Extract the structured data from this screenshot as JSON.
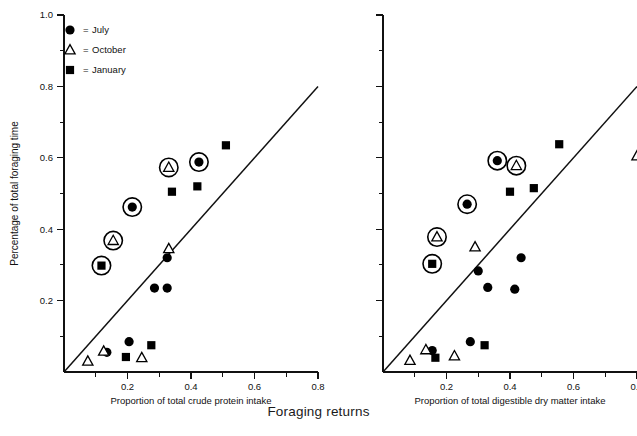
{
  "figure": {
    "shared_xlabel": "Foraging returns",
    "ylabel": "Percentage of total foraging time"
  },
  "legend": {
    "items": [
      {
        "symbol": "filled-circle",
        "separator": "=",
        "label": "July"
      },
      {
        "symbol": "open-triangle",
        "separator": "=",
        "label": "October"
      },
      {
        "symbol": "filled-square",
        "separator": "=",
        "label": "January"
      }
    ]
  },
  "axes": {
    "y_ticks": [
      "0.2",
      "0.4",
      "0.6",
      "0.8",
      "1.0"
    ],
    "x_ticks": [
      "0.2",
      "0.4",
      "0.6",
      "0.8"
    ],
    "y_tick_values": [
      0.2,
      0.4,
      0.6,
      0.8,
      1.0
    ],
    "x_tick_values": [
      0.2,
      0.4,
      0.6,
      0.8
    ],
    "y_minor_values": [
      0.1,
      0.3,
      0.5,
      0.7,
      0.9
    ],
    "x_minor_values": [
      0.1,
      0.3,
      0.5,
      0.7
    ]
  },
  "chart_data": [
    {
      "type": "scatter",
      "panel": "left",
      "title": "",
      "xlabel": "Proportion of total crude protein intake",
      "ylabel": "Percentage of total foraging time",
      "xlim": [
        0.0,
        0.8
      ],
      "ylim": [
        0.0,
        1.0
      ],
      "grid": false,
      "legend_position": "top-left",
      "reference_line": {
        "label": "1:1 line",
        "x": [
          0.0,
          0.8
        ],
        "y": [
          0.0,
          0.8
        ]
      },
      "series": [
        {
          "name": "July",
          "marker": "filled-circle",
          "points": [
            {
              "x": 0.135,
              "y": 0.055,
              "highlighted": false
            },
            {
              "x": 0.205,
              "y": 0.085,
              "highlighted": false
            },
            {
              "x": 0.285,
              "y": 0.235,
              "highlighted": false
            },
            {
              "x": 0.325,
              "y": 0.235,
              "highlighted": false
            },
            {
              "x": 0.325,
              "y": 0.32,
              "highlighted": false
            },
            {
              "x": 0.215,
              "y": 0.462,
              "highlighted": true
            },
            {
              "x": 0.425,
              "y": 0.588,
              "highlighted": true
            }
          ]
        },
        {
          "name": "October",
          "marker": "open-triangle",
          "points": [
            {
              "x": 0.075,
              "y": 0.03,
              "highlighted": false
            },
            {
              "x": 0.125,
              "y": 0.058,
              "highlighted": false
            },
            {
              "x": 0.245,
              "y": 0.04,
              "highlighted": false
            },
            {
              "x": 0.33,
              "y": 0.345,
              "highlighted": false
            },
            {
              "x": 0.155,
              "y": 0.368,
              "highlighted": true
            },
            {
              "x": 0.33,
              "y": 0.573,
              "highlighted": true
            }
          ]
        },
        {
          "name": "January",
          "marker": "filled-square",
          "points": [
            {
              "x": 0.195,
              "y": 0.042,
              "highlighted": false
            },
            {
              "x": 0.275,
              "y": 0.075,
              "highlighted": false
            },
            {
              "x": 0.34,
              "y": 0.505,
              "highlighted": false
            },
            {
              "x": 0.42,
              "y": 0.52,
              "highlighted": false
            },
            {
              "x": 0.51,
              "y": 0.635,
              "highlighted": false
            },
            {
              "x": 0.118,
              "y": 0.298,
              "highlighted": true
            }
          ]
        }
      ]
    },
    {
      "type": "scatter",
      "panel": "right",
      "title": "",
      "xlabel": "Proportion of total digestible dry matter intake",
      "ylabel": "Percentage of total foraging time",
      "xlim": [
        0.0,
        0.8
      ],
      "ylim": [
        0.0,
        1.0
      ],
      "grid": false,
      "legend_position": "none",
      "reference_line": {
        "label": "1:1 line",
        "x": [
          0.0,
          0.8
        ],
        "y": [
          0.0,
          0.8
        ]
      },
      "series": [
        {
          "name": "July",
          "marker": "filled-circle",
          "points": [
            {
              "x": 0.155,
              "y": 0.06,
              "highlighted": false
            },
            {
              "x": 0.275,
              "y": 0.085,
              "highlighted": false
            },
            {
              "x": 0.33,
              "y": 0.237,
              "highlighted": false
            },
            {
              "x": 0.415,
              "y": 0.232,
              "highlighted": false
            },
            {
              "x": 0.3,
              "y": 0.283,
              "highlighted": false
            },
            {
              "x": 0.435,
              "y": 0.32,
              "highlighted": false
            },
            {
              "x": 0.265,
              "y": 0.47,
              "highlighted": true
            },
            {
              "x": 0.36,
              "y": 0.592,
              "highlighted": true
            }
          ]
        },
        {
          "name": "October",
          "marker": "open-triangle",
          "points": [
            {
              "x": 0.085,
              "y": 0.032,
              "highlighted": false
            },
            {
              "x": 0.135,
              "y": 0.062,
              "highlighted": false
            },
            {
              "x": 0.225,
              "y": 0.045,
              "highlighted": false
            },
            {
              "x": 0.29,
              "y": 0.35,
              "highlighted": false
            },
            {
              "x": 0.8,
              "y": 0.605,
              "highlighted": false
            },
            {
              "x": 0.17,
              "y": 0.378,
              "highlighted": true
            },
            {
              "x": 0.42,
              "y": 0.578,
              "highlighted": true
            }
          ]
        },
        {
          "name": "January",
          "marker": "filled-square",
          "points": [
            {
              "x": 0.165,
              "y": 0.04,
              "highlighted": false
            },
            {
              "x": 0.32,
              "y": 0.075,
              "highlighted": false
            },
            {
              "x": 0.4,
              "y": 0.505,
              "highlighted": false
            },
            {
              "x": 0.475,
              "y": 0.515,
              "highlighted": false
            },
            {
              "x": 0.555,
              "y": 0.638,
              "highlighted": false
            },
            {
              "x": 0.155,
              "y": 0.303,
              "highlighted": true
            }
          ]
        }
      ]
    }
  ]
}
